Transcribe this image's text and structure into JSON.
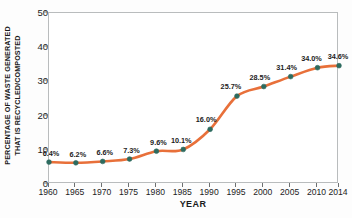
{
  "chart_data": {
    "type": "line",
    "title": "",
    "xlabel": "YEAR",
    "ylabel": "PERCENTAGE OF WASTE GENERATED THAT IS RECYCLED/COMPOSTED",
    "ylabel_line1": "PERCENTAGE OF WASTE GENERATED",
    "ylabel_line2": "THAT IS RECYCLED/COMPOSTED",
    "categories": [
      "1960",
      "1965",
      "1970",
      "1975",
      "1980",
      "1985",
      "1990",
      "1995",
      "2000",
      "2005",
      "2010",
      "2014"
    ],
    "x": [
      1960,
      1965,
      1970,
      1975,
      1980,
      1985,
      1990,
      1995,
      2000,
      2005,
      2010,
      2014
    ],
    "values": [
      6.4,
      6.2,
      6.6,
      7.3,
      9.6,
      10.1,
      16.0,
      25.7,
      28.5,
      31.4,
      34.0,
      34.6
    ],
    "point_labels": [
      "6.4%",
      "6.2%",
      "6.6%",
      "7.3%",
      "9.6%",
      "10.1%",
      "16.0%",
      "25.7%",
      "28.5%",
      "31.4%",
      "34.0%",
      "34.6%"
    ],
    "ylim": [
      0,
      50
    ],
    "xlim": [
      1960,
      2014
    ],
    "yticks": [
      0,
      10,
      20,
      30,
      40,
      50
    ],
    "ytick_labels": [
      "0",
      "10",
      "20",
      "30",
      "40",
      "50"
    ],
    "grid": false,
    "legend": false,
    "legend_position": "none",
    "series": [
      {
        "name": "Percentage recycled/composted",
        "values": [
          6.4,
          6.2,
          6.6,
          7.3,
          9.6,
          10.1,
          16.0,
          25.7,
          28.5,
          31.4,
          34.0,
          34.6
        ]
      }
    ]
  },
  "colors": {
    "line": "#e8703a",
    "marker_fill": "#2d6b5f",
    "marker_edge": "#2d6b5f",
    "axis": "#b9bcbd",
    "tick": "#6d7071",
    "text": "#1c1c1c",
    "background": "#fdfdfd",
    "plot_background": "#ffffff"
  }
}
